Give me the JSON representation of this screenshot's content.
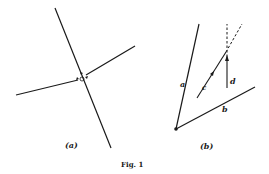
{
  "figure": {
    "caption": "Fig. 1",
    "panels": [
      {
        "id": "a",
        "label": "(a)",
        "description": "Two lines crossing at a junction with small arrow marks near the intersection"
      },
      {
        "id": "b",
        "label": "(b)",
        "description": "Angle formed by lines a and b from a vertex point; dashed line with arrow c and vertical dashed line with arrow d",
        "segment_labels": {
          "a": "a",
          "b": "b",
          "c": "c",
          "d": "d"
        }
      }
    ],
    "colors": {
      "ink": "#1a1a1a",
      "background": "#ffffff"
    }
  }
}
